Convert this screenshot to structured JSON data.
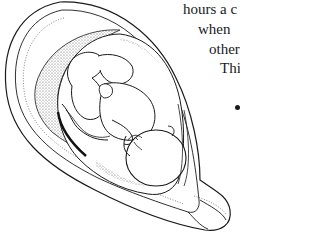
{
  "figure": {
    "style": "black-and-white line drawing with stippled shading"
  },
  "text_fragments": [
    {
      "text": "hours a c",
      "x": 183,
      "y": 2
    },
    {
      "text": "when",
      "x": 198,
      "y": 22
    },
    {
      "text": "other",
      "x": 209,
      "y": 42
    },
    {
      "text": "This",
      "x": 220,
      "y": 61
    }
  ],
  "colors": {
    "ink": "#1a1a1a",
    "background": "#ffffff",
    "stipple": "#6e6e6e"
  }
}
